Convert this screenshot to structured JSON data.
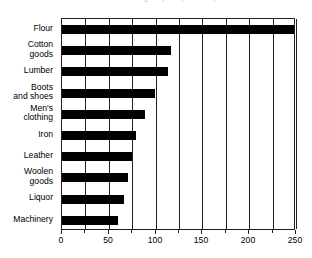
{
  "figure": {
    "clipped_title_remnant": "manufacturing output by industry",
    "background_color": "#ffffff",
    "bar_color": "#000000",
    "axis_color": "#231f20"
  },
  "chart_data": {
    "type": "bar",
    "orientation": "horizontal",
    "title": "",
    "xlabel": "",
    "ylabel": "",
    "categories": [
      "Flour",
      "Cotton\ngoods",
      "Lumber",
      "Boots\nand shoes",
      "Men's\nclothing",
      "Iron",
      "Leather",
      "Woolen\ngoods",
      "Liquor",
      "Machinery"
    ],
    "values": [
      253,
      116,
      113,
      99,
      89,
      79,
      75,
      71,
      66,
      60
    ],
    "xlim": [
      0,
      250
    ],
    "xticks": [
      0,
      50,
      100,
      150,
      200,
      250
    ],
    "xtick_labels": [
      "0",
      "50",
      "100",
      "150",
      "200",
      "250"
    ],
    "xminor_ticks": [
      25,
      75,
      125,
      175,
      225
    ],
    "grid": true,
    "grid_axis": "x",
    "legend": null
  }
}
